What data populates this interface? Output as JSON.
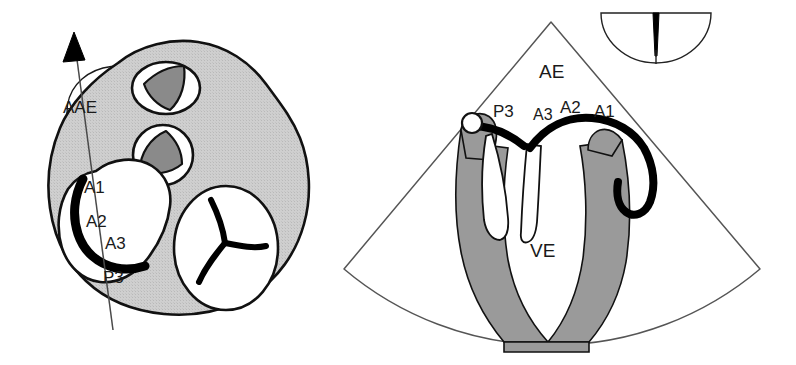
{
  "figure": {
    "colors": {
      "outline": "#111111",
      "myocardium_light_gray": "#c9c9c9",
      "valve_dark_gray": "#8a8a8a",
      "leaflet_black": "#000000",
      "sector_line": "#4a4a4a",
      "background": "#ffffff"
    }
  },
  "left_panel": {
    "name": "short-axis-valve-plane",
    "labels": {
      "aae": "AAE",
      "a1": "A1",
      "a2": "A2",
      "a3": "A3",
      "p3": "P3"
    },
    "structures": [
      {
        "id": "aortic-valve",
        "fill": "dark-gray",
        "position": "upper"
      },
      {
        "id": "pulmonary-valve",
        "fill": "dark-gray",
        "position": "middle"
      },
      {
        "id": "tricuspid-valve",
        "fill": "white",
        "position": "right"
      },
      {
        "id": "mitral-valve",
        "fill": "black",
        "position": "left"
      }
    ],
    "scan_line": {
      "id": "scan-plane-line",
      "arrow": "up"
    }
  },
  "right_panel": {
    "name": "apical-long-axis-sector",
    "labels": {
      "ae": "AE",
      "ve": "VE",
      "p3": "P3",
      "a3": "A3",
      "a2": "A2",
      "a1": "A1"
    },
    "structures": [
      {
        "id": "atrium-chamber",
        "label": "AE"
      },
      {
        "id": "ventricle-chamber",
        "label": "VE"
      },
      {
        "id": "anterior-leaflet",
        "fill": "black"
      },
      {
        "id": "posterior-leaflet",
        "fill": "black"
      },
      {
        "id": "annulus-marker",
        "fill": "white"
      }
    ]
  },
  "inset": {
    "name": "transducer-orientation-inset",
    "shape": "semicircle",
    "marker": "vertical-tapered-black-wedge"
  }
}
